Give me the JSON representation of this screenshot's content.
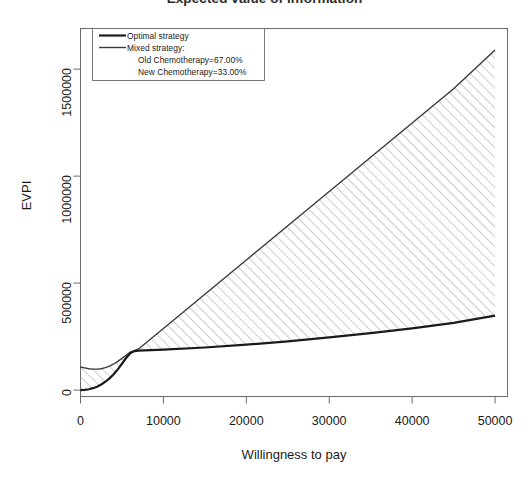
{
  "chart_data": {
    "type": "line",
    "title": "Expected value of information",
    "xlabel": "Willingness to pay",
    "ylabel": "EVPI",
    "xlim": [
      0,
      51500
    ],
    "ylim": [
      -30000,
      1690000
    ],
    "grid": false,
    "legend_position": "top-left",
    "xticks": [
      0,
      10000,
      20000,
      30000,
      40000,
      50000
    ],
    "xtick_labels": [
      "0",
      "10000",
      "20000",
      "30000",
      "40000",
      "50000"
    ],
    "yticks": [
      0,
      500000,
      1000000,
      1500000
    ],
    "ytick_labels": [
      "0",
      "500000",
      "1000000",
      "1500000"
    ],
    "annotations": {
      "shaded_region": "Hatched area between optimal strategy and mixed strategy curves"
    },
    "series": [
      {
        "name": "Optimal strategy",
        "color": "#1a1a1a",
        "linewidth": 2.2,
        "x": [
          0,
          500,
          1000,
          1500,
          2000,
          2500,
          3000,
          3500,
          4000,
          4500,
          5000,
          5500,
          6000,
          6500,
          7000,
          10000,
          15000,
          20000,
          25000,
          30000,
          35000,
          40000,
          45000,
          50000
        ],
        "values": [
          0,
          1000,
          4000,
          9000,
          16000,
          26000,
          39000,
          55000,
          74000,
          97000,
          123000,
          150000,
          172000,
          182000,
          184000,
          189000,
          199000,
          212000,
          228000,
          246000,
          266000,
          288000,
          314000,
          348000
        ]
      },
      {
        "name": "Mixed strategy",
        "color": "#3a3a3a",
        "linewidth": 1.4,
        "x": [
          0,
          500,
          1000,
          1500,
          2000,
          2500,
          3000,
          3500,
          4000,
          4500,
          5000,
          5500,
          6000,
          6500,
          7000,
          10000,
          15000,
          20000,
          25000,
          30000,
          35000,
          40000,
          45000,
          50000
        ],
        "values": [
          108000,
          104000,
          100000,
          98000,
          98000,
          100000,
          105000,
          112000,
          122000,
          134000,
          148000,
          163000,
          177000,
          184000,
          192000,
          288000,
          448000,
          608000,
          768000,
          928000,
          1088000,
          1248000,
          1408000,
          1590000
        ]
      }
    ]
  },
  "legend": {
    "optimal_label": "Optimal strategy",
    "mixed_label": "Mixed strategy:",
    "old_chemo_label": "Old Chemotherapy=67.00%",
    "new_chemo_label": "New Chemotherapy=33.00%"
  },
  "colors": {
    "axis": "#555555",
    "optimal_line": "#1a1a1a",
    "mixed_line": "#3a3a3a",
    "hatch": "#8a8a8a",
    "background": "#ffffff"
  }
}
